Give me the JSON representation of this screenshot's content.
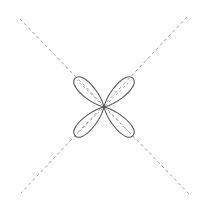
{
  "diagram": {
    "type": "four-lobed polar figure",
    "canvas": {
      "width": 200,
      "height": 204
    },
    "center": {
      "x": 104,
      "y": 107
    },
    "colors": {
      "background": "#ffffff",
      "lobe_stroke": "#555555",
      "axis_dash": "#9a9a9a",
      "inner_dash": "#aaaaaa"
    },
    "axes": [
      {
        "name": "diagonal-nw-se",
        "x1": 20,
        "y1": 19,
        "x2": 190,
        "y2": 195
      },
      {
        "name": "diagonal-ne-sw",
        "x1": 187,
        "y1": 17,
        "x2": 21,
        "y2": 193
      }
    ],
    "lobes": [
      {
        "name": "lobe-upper-left",
        "angle_deg": 225,
        "length": 40,
        "width": 14
      },
      {
        "name": "lobe-upper-right",
        "angle_deg": 315,
        "length": 40,
        "width": 14
      },
      {
        "name": "lobe-lower-left",
        "angle_deg": 135,
        "length": 40,
        "width": 14
      },
      {
        "name": "lobe-lower-right",
        "angle_deg": 45,
        "length": 40,
        "width": 14
      }
    ]
  }
}
